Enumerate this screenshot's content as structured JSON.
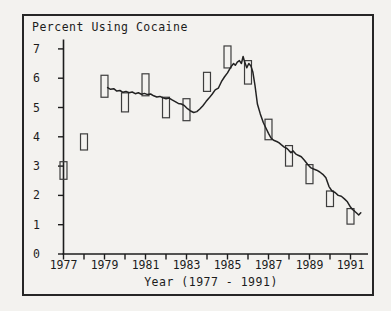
{
  "figure": {
    "background": "#f3f2ef",
    "frame_border_color": "#262626",
    "ink_color": "#1c1c1c"
  },
  "chart_data": {
    "type": "line",
    "title": "Percent Using Cocaine",
    "xlabel": "Year (1977 - 1991)",
    "ylabel": "",
    "xlim": [
      1977,
      1991.85
    ],
    "ylim": [
      0,
      7.32
    ],
    "grid": false,
    "y_ticks": [
      0,
      1,
      2,
      3,
      4,
      5,
      6,
      7
    ],
    "x_minor_tick_years": [
      1977,
      1978,
      1979,
      1980,
      1981,
      1982,
      1983,
      1984,
      1985,
      1986,
      1987,
      1988,
      1989,
      1990,
      1991
    ],
    "x_tick_label_years": [
      1977,
      1979,
      1981,
      1983,
      1985,
      1987,
      1989,
      1991
    ],
    "x_tick_labels": [
      "1977",
      "1979",
      "1981",
      "1983",
      "1985",
      "1987",
      "1989",
      "1991"
    ],
    "line_color": "#222222",
    "box_color": "#3d3d3d",
    "series": [
      {
        "name": "percent-using-cocaine-trend",
        "points": [
          [
            1979.15,
            5.68
          ],
          [
            1979.3,
            5.62
          ],
          [
            1979.45,
            5.64
          ],
          [
            1979.6,
            5.56
          ],
          [
            1979.75,
            5.58
          ],
          [
            1979.9,
            5.52
          ],
          [
            1980.05,
            5.55
          ],
          [
            1980.2,
            5.5
          ],
          [
            1980.35,
            5.53
          ],
          [
            1980.5,
            5.47
          ],
          [
            1980.65,
            5.5
          ],
          [
            1980.8,
            5.45
          ],
          [
            1980.95,
            5.48
          ],
          [
            1981.1,
            5.44
          ],
          [
            1981.25,
            5.46
          ],
          [
            1981.4,
            5.4
          ],
          [
            1981.55,
            5.36
          ],
          [
            1981.7,
            5.38
          ],
          [
            1981.85,
            5.33
          ],
          [
            1982.0,
            5.3
          ],
          [
            1982.15,
            5.32
          ],
          [
            1982.3,
            5.26
          ],
          [
            1982.45,
            5.2
          ],
          [
            1982.6,
            5.14
          ],
          [
            1982.75,
            5.12
          ],
          [
            1982.9,
            5.06
          ],
          [
            1983.05,
            4.96
          ],
          [
            1983.2,
            4.88
          ],
          [
            1983.35,
            4.83
          ],
          [
            1983.5,
            4.86
          ],
          [
            1983.65,
            4.95
          ],
          [
            1983.8,
            5.06
          ],
          [
            1983.95,
            5.2
          ],
          [
            1984.1,
            5.32
          ],
          [
            1984.25,
            5.45
          ],
          [
            1984.4,
            5.6
          ],
          [
            1984.55,
            5.66
          ],
          [
            1984.7,
            5.88
          ],
          [
            1984.85,
            6.04
          ],
          [
            1985.0,
            6.18
          ],
          [
            1985.1,
            6.3
          ],
          [
            1985.2,
            6.42
          ],
          [
            1985.3,
            6.5
          ],
          [
            1985.38,
            6.44
          ],
          [
            1985.48,
            6.55
          ],
          [
            1985.58,
            6.6
          ],
          [
            1985.68,
            6.5
          ],
          [
            1985.76,
            6.74
          ],
          [
            1985.84,
            6.55
          ],
          [
            1985.94,
            6.36
          ],
          [
            1986.04,
            6.5
          ],
          [
            1986.14,
            6.42
          ],
          [
            1986.24,
            6.2
          ],
          [
            1986.34,
            5.75
          ],
          [
            1986.46,
            5.12
          ],
          [
            1986.6,
            4.78
          ],
          [
            1986.75,
            4.48
          ],
          [
            1986.9,
            4.26
          ],
          [
            1987.0,
            4.12
          ],
          [
            1987.12,
            3.96
          ],
          [
            1987.25,
            3.88
          ],
          [
            1987.4,
            3.84
          ],
          [
            1987.5,
            3.8
          ],
          [
            1987.62,
            3.73
          ],
          [
            1987.75,
            3.66
          ],
          [
            1987.9,
            3.6
          ],
          [
            1988.0,
            3.53
          ],
          [
            1988.1,
            3.46
          ],
          [
            1988.2,
            3.52
          ],
          [
            1988.32,
            3.42
          ],
          [
            1988.45,
            3.37
          ],
          [
            1988.6,
            3.32
          ],
          [
            1988.75,
            3.2
          ],
          [
            1988.9,
            3.06
          ],
          [
            1989.05,
            2.95
          ],
          [
            1989.2,
            2.9
          ],
          [
            1989.35,
            2.86
          ],
          [
            1989.5,
            2.8
          ],
          [
            1989.65,
            2.72
          ],
          [
            1989.8,
            2.6
          ],
          [
            1989.95,
            2.3
          ],
          [
            1990.1,
            2.15
          ],
          [
            1990.25,
            2.1
          ],
          [
            1990.4,
            2.0
          ],
          [
            1990.55,
            1.97
          ],
          [
            1990.7,
            1.88
          ],
          [
            1990.85,
            1.78
          ],
          [
            1991.0,
            1.6
          ],
          [
            1991.1,
            1.52
          ],
          [
            1991.2,
            1.46
          ],
          [
            1991.3,
            1.4
          ],
          [
            1991.4,
            1.33
          ],
          [
            1991.5,
            1.41
          ]
        ]
      }
    ],
    "error_boxes": {
      "name": "annual-estimate-range-boxes",
      "box_width_years": 0.34,
      "items": [
        {
          "year": 1977,
          "low": 2.55,
          "high": 3.15
        },
        {
          "year": 1978,
          "low": 3.55,
          "high": 4.1
        },
        {
          "year": 1979,
          "low": 5.35,
          "high": 6.1
        },
        {
          "year": 1980,
          "low": 4.85,
          "high": 5.5
        },
        {
          "year": 1981,
          "low": 5.4,
          "high": 6.15
        },
        {
          "year": 1982,
          "low": 4.65,
          "high": 5.35
        },
        {
          "year": 1983,
          "low": 4.55,
          "high": 5.3
        },
        {
          "year": 1984,
          "low": 5.55,
          "high": 6.2
        },
        {
          "year": 1985,
          "low": 6.35,
          "high": 7.1
        },
        {
          "year": 1986,
          "low": 5.8,
          "high": 6.6
        },
        {
          "year": 1987,
          "low": 3.9,
          "high": 4.6
        },
        {
          "year": 1988,
          "low": 3.0,
          "high": 3.7
        },
        {
          "year": 1989,
          "low": 2.4,
          "high": 3.05
        },
        {
          "year": 1990,
          "low": 1.62,
          "high": 2.15
        },
        {
          "year": 1991,
          "low": 1.02,
          "high": 1.55
        }
      ]
    }
  }
}
